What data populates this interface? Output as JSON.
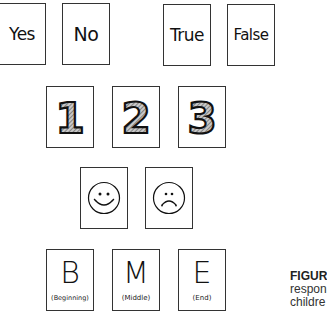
{
  "rows": {
    "answers": [
      {
        "label": "Yes"
      },
      {
        "label": "No"
      },
      {
        "label": "True"
      },
      {
        "label": "False"
      }
    ],
    "numbers": [
      {
        "label": "1"
      },
      {
        "label": "2"
      },
      {
        "label": "3"
      }
    ],
    "faces": [
      {
        "label": "happy-face"
      },
      {
        "label": "sad-face"
      }
    ],
    "positions": [
      {
        "letter": "B",
        "sub": "(Beginning)"
      },
      {
        "letter": "M",
        "sub": "(Middle)"
      },
      {
        "letter": "E",
        "sub": "(End)"
      }
    ]
  },
  "caption": {
    "label": "FIGUR",
    "line2": "respon",
    "line3": "childre"
  },
  "colors": {
    "border": "#333333",
    "digit_fill": "#9a9a9a",
    "text": "#111111"
  }
}
